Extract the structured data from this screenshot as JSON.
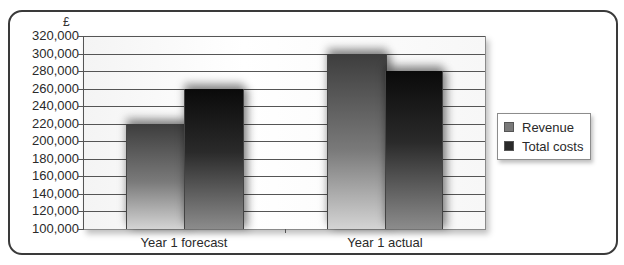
{
  "chart_data": {
    "type": "bar",
    "title": "",
    "ylabel": "£",
    "xlabel": "",
    "categories": [
      "Year 1 forecast",
      "Year 1 actual"
    ],
    "series": [
      {
        "name": "Revenue",
        "values": [
          220000,
          300000
        ],
        "color": "#6e6e6e"
      },
      {
        "name": "Total costs",
        "values": [
          260000,
          280000
        ],
        "color": "#1a1a1a"
      }
    ],
    "ylim": [
      100000,
      320000
    ],
    "yticks": [
      "320,000",
      "300,000",
      "280,000",
      "260,000",
      "240,000",
      "220,000",
      "200,000",
      "180,000",
      "160,000",
      "140,000",
      "120,000",
      "100,000"
    ],
    "grid": true,
    "legend_position": "right"
  },
  "axis": {
    "currency_symbol": "£"
  },
  "legend": {
    "items": [
      {
        "label": "Revenue",
        "color": "#7a7a7a"
      },
      {
        "label": "Total costs",
        "color": "#2a2a2a"
      }
    ]
  }
}
